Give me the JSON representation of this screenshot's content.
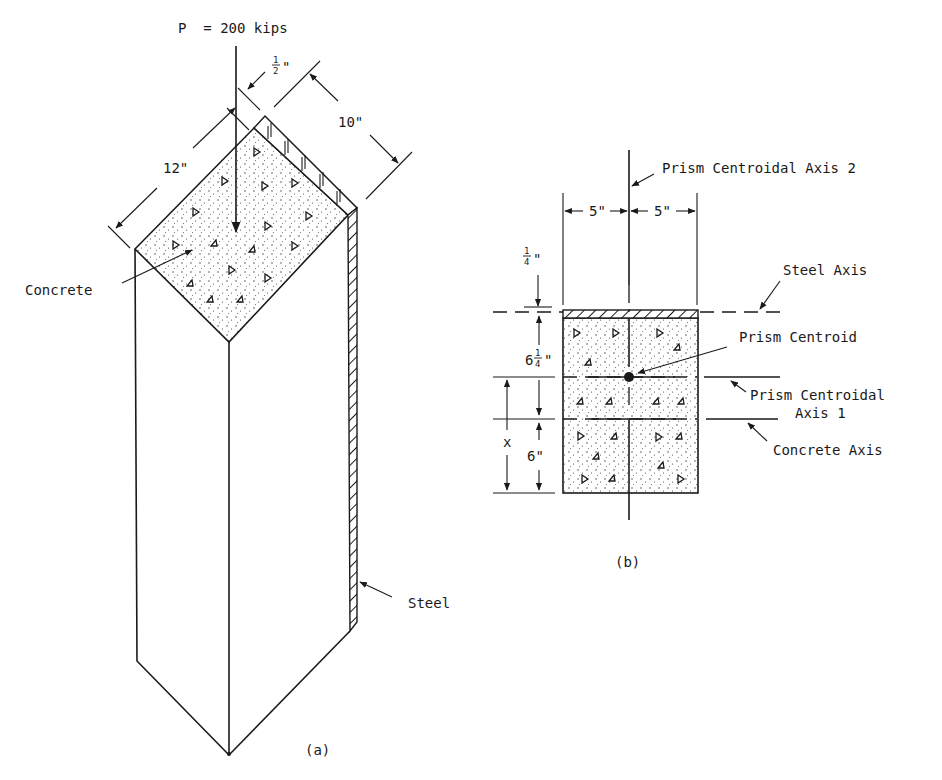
{
  "figure_a": {
    "caption": "(a)",
    "load_label": "P  = 200 kips",
    "dim_steel_thickness": "1/2\"",
    "dim_steel_num": "1",
    "dim_steel_den": "2",
    "dim_width": "12\"",
    "dim_depth": "10\"",
    "label_concrete": "Concrete",
    "label_steel": "Steel"
  },
  "figure_b": {
    "caption": "(b)",
    "label_axis2": "Prism Centroidal Axis 2",
    "label_steel_axis": "Steel Axis",
    "label_centroid": "Prism Centroid",
    "label_axis1_line1": "Prism Centroidal",
    "label_axis1_line2": "Axis 1",
    "label_concrete_axis": "Concrete Axis",
    "dim_half_width_left": "5\"",
    "dim_half_width_right": "5\"",
    "dim_steel_thickness_num": "1",
    "dim_steel_thickness_den": "4",
    "dim_steel_thickness_unit": "\"",
    "dim_to_concrete_axis_whole": "6",
    "dim_to_concrete_axis_num": "1",
    "dim_to_concrete_axis_den": "4",
    "dim_to_concrete_axis_unit": "\"",
    "dim_concrete_half": "6\"",
    "dim_x": "x"
  }
}
